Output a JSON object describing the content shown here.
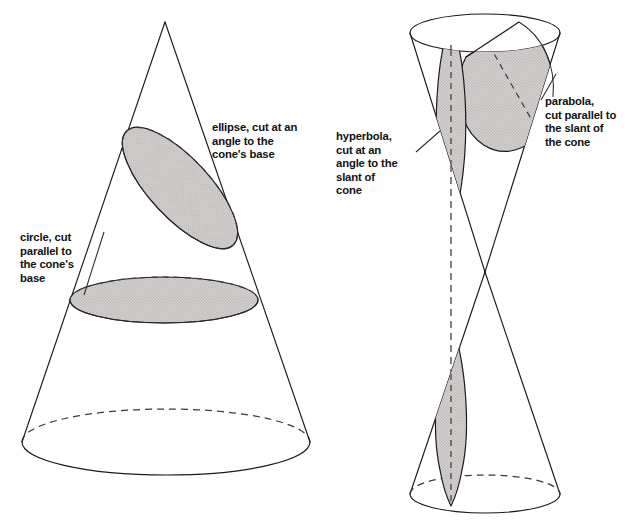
{
  "figure": {
    "background_color": "#ffffff",
    "line_color": "#1a1a1a",
    "cut_fill_color": "#cfcccb"
  },
  "labels": {
    "ellipse": {
      "name": "ellipse-label",
      "lines": [
        "ellipse, cut at an",
        "angle to the",
        "cone's base"
      ],
      "line1": "ellipse, cut at an",
      "line2": "angle to the",
      "line3": "cone's base",
      "x": 212,
      "y": 131
    },
    "circle": {
      "name": "circle-label",
      "lines": [
        "circle, cut",
        "parallel to",
        "the cone's",
        "base"
      ],
      "line1": "circle, cut",
      "line2": "parallel to",
      "line3": "the cone's",
      "line4": "base",
      "x": 20,
      "y": 241
    },
    "hyperbola": {
      "name": "hyperbola-label",
      "lines": [
        "hyperbola,",
        "cut at an",
        "angle to the",
        "slant of",
        "cone"
      ],
      "line1": "hyperbola,",
      "line2": "cut at an",
      "line3": "angle to the",
      "line4": "slant of",
      "line5": "cone",
      "x": 336,
      "y": 140
    },
    "parabola": {
      "name": "parabola-label",
      "lines": [
        "parabola,",
        "cut parallel to",
        "the slant of",
        "the cone"
      ],
      "line1": "parabola,",
      "line2": "cut parallel to",
      "line3": "the slant of",
      "line4": "the cone",
      "x": 545,
      "y": 105
    }
  },
  "left_figure": {
    "name": "single-cone",
    "apex": {
      "x": 165,
      "y": 22
    },
    "base_ellipse": {
      "cx": 166,
      "cy": 442,
      "rx": 144,
      "ry": 33
    },
    "circle_cut": {
      "cx": 164,
      "cy": 300,
      "rx": 94,
      "ry": 23
    },
    "ellipse_cut": {
      "cx": 180,
      "cy": 188,
      "rx": 78,
      "ry": 30,
      "rotation": 47
    }
  },
  "right_figure": {
    "name": "double-cone",
    "vertex": {
      "x": 485,
      "y": 272
    },
    "top_rim": {
      "cx": 485,
      "cy": 33,
      "rx": 75,
      "ry": 19
    },
    "bottom_rim": {
      "cx": 485,
      "cy": 494,
      "rx": 75,
      "ry": 19
    },
    "hyperbola_cut_top": {
      "cx": 451,
      "cy": 140,
      "rx": 15,
      "ry": 90
    },
    "hyperbola_cut_bottom": {
      "cx": 451,
      "cy": 400,
      "rx": 15,
      "ry": 90
    },
    "parabola_cut": {
      "note": "tilted slice parallel to the cone slant on the right side of the top nappe"
    }
  }
}
